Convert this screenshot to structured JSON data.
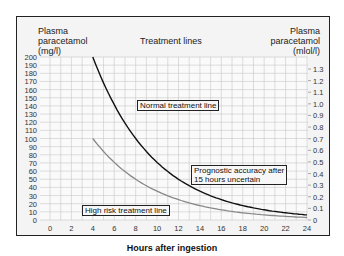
{
  "chart_data": {
    "type": "line",
    "title": "Treatment lines",
    "xlabel": "Hours after ingestion",
    "ylabel": "Plasma paracetamol (mg/l)",
    "y2label": "Plasma paracetamol (mmol/l)",
    "x_ticks": [
      0,
      2,
      4,
      6,
      8,
      10,
      12,
      14,
      16,
      18,
      20,
      22,
      24
    ],
    "y_ticks": [
      0,
      10,
      20,
      30,
      40,
      50,
      60,
      70,
      80,
      90,
      100,
      110,
      120,
      130,
      140,
      150,
      160,
      170,
      180,
      190,
      200
    ],
    "y2_ticks": [
      "0",
      "0.1",
      "0.2",
      "0.3",
      "0.4",
      "0.5",
      "0.6",
      "0.7",
      "0.8",
      "0.9",
      "1.0",
      "1.1",
      "1.2",
      "1.3"
    ],
    "xlim": [
      0,
      24
    ],
    "ylim": [
      0,
      200
    ],
    "y2lim": [
      0,
      1.3
    ],
    "grid": true,
    "series": [
      {
        "name": "Normal treatment line",
        "color": "#111111",
        "x": [
          4,
          6,
          8,
          10,
          12,
          14,
          16,
          18,
          20,
          22,
          24
        ],
        "y": [
          200,
          141,
          100,
          71,
          50,
          35,
          25,
          18,
          12.5,
          9,
          6
        ]
      },
      {
        "name": "High risk treatment line",
        "color": "#888888",
        "x": [
          4,
          6,
          8,
          10,
          12,
          14,
          16,
          18,
          20,
          22,
          24
        ],
        "y": [
          100,
          71,
          50,
          35,
          25,
          18,
          12.5,
          9,
          6,
          4.5,
          3
        ]
      }
    ],
    "annotations": [
      "Normal treatment line",
      "Prognostic accuracy after 15 hours uncertain",
      "High risk treatment line"
    ]
  },
  "labels": {
    "y_left_title_1": "Plasma",
    "y_left_title_2": "paracetamol",
    "y_left_title_3": "(mg/l)",
    "y_right_title_1": "Plasma",
    "y_right_title_2": "paracetamol",
    "y_right_title_3": "(mlol/l)",
    "chart_title": "Treatment lines",
    "x_title": "Hours after ingestion",
    "normal_line": "Normal treatment line",
    "prognostic_1": "Prognostic accuracy after",
    "prognostic_2": "15 hours uncertain",
    "high_risk": "High risk treatment line"
  }
}
